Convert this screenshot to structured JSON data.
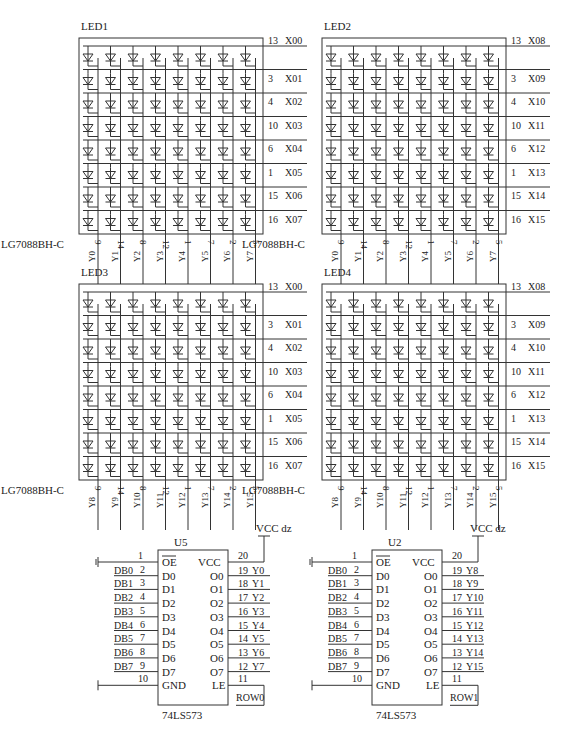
{
  "matrices": [
    {
      "ref": "LED1",
      "part": "LG7088BH-C",
      "x": 79,
      "y": 38,
      "rows": [
        [
          "13",
          "X00"
        ],
        [
          "3",
          "X01"
        ],
        [
          "4",
          "X02"
        ],
        [
          "10",
          "X03"
        ],
        [
          "6",
          "X04"
        ],
        [
          "1",
          "X05"
        ],
        [
          "15",
          "X06"
        ],
        [
          "16",
          "X07"
        ]
      ],
      "cols": [
        [
          "9",
          "Y0"
        ],
        [
          "14",
          "Y1"
        ],
        [
          "8",
          "Y2"
        ],
        [
          "12",
          "Y3"
        ],
        [
          "1",
          "Y4"
        ],
        [
          "7",
          "Y5"
        ],
        [
          "2",
          "Y6"
        ],
        [
          "5",
          "Y7"
        ]
      ]
    },
    {
      "ref": "LED2",
      "part": "LG7088BH-C",
      "x": 322,
      "y": 38,
      "rows": [
        [
          "13",
          "X08"
        ],
        [
          "3",
          "X09"
        ],
        [
          "4",
          "X10"
        ],
        [
          "10",
          "X11"
        ],
        [
          "6",
          "X12"
        ],
        [
          "1",
          "X13"
        ],
        [
          "15",
          "X14"
        ],
        [
          "16",
          "X15"
        ]
      ],
      "cols": [
        [
          "9",
          "Y0"
        ],
        [
          "14",
          "Y1"
        ],
        [
          "8",
          "Y2"
        ],
        [
          "12",
          "Y3"
        ],
        [
          "1",
          "Y4"
        ],
        [
          "7",
          "Y5"
        ],
        [
          "2",
          "Y6"
        ],
        [
          "5",
          "Y7"
        ]
      ]
    },
    {
      "ref": "LED3",
      "part": "LG7088BH-C",
      "x": 79,
      "y": 284,
      "rows": [
        [
          "13",
          "X00"
        ],
        [
          "3",
          "X01"
        ],
        [
          "4",
          "X02"
        ],
        [
          "10",
          "X03"
        ],
        [
          "6",
          "X04"
        ],
        [
          "1",
          "X05"
        ],
        [
          "15",
          "X06"
        ],
        [
          "16",
          "X07"
        ]
      ],
      "cols": [
        [
          "9",
          "Y8"
        ],
        [
          "14",
          "Y9"
        ],
        [
          "8",
          "Y10"
        ],
        [
          "12",
          "Y11"
        ],
        [
          "1",
          "Y12"
        ],
        [
          "7",
          "Y13"
        ],
        [
          "2",
          "Y14"
        ],
        [
          "5",
          "Y15"
        ]
      ]
    },
    {
      "ref": "LED4",
      "part": "LG7088BH-C",
      "x": 322,
      "y": 284,
      "rows": [
        [
          "13",
          "X08"
        ],
        [
          "3",
          "X09"
        ],
        [
          "4",
          "X10"
        ],
        [
          "10",
          "X11"
        ],
        [
          "6",
          "X12"
        ],
        [
          "1",
          "X13"
        ],
        [
          "15",
          "X14"
        ],
        [
          "16",
          "X15"
        ]
      ],
      "cols": [
        [
          "9",
          "Y8"
        ],
        [
          "14",
          "Y9"
        ],
        [
          "8",
          "Y10"
        ],
        [
          "12",
          "Y11"
        ],
        [
          "1",
          "Y12"
        ],
        [
          "7",
          "Y13"
        ],
        [
          "2",
          "Y14"
        ],
        [
          "5",
          "Y15"
        ]
      ]
    }
  ],
  "latches": [
    {
      "ref": "U5",
      "part": "74LS573",
      "x": 158,
      "y": 550,
      "power_label": "VCC dz",
      "oe_pin": "1",
      "oe_label": "OE",
      "vcc_pin": "20",
      "vcc_label": "VCC",
      "gnd_pin": "10",
      "gnd_label": "GND",
      "le_pin": "11",
      "le_label": "LE",
      "le_net": "ROW0",
      "inputs": [
        [
          "DB0",
          "2",
          "D0"
        ],
        [
          "DB1",
          "3",
          "D1"
        ],
        [
          "DB2",
          "4",
          "D2"
        ],
        [
          "DB3",
          "5",
          "D3"
        ],
        [
          "DB4",
          "6",
          "D4"
        ],
        [
          "DB5",
          "7",
          "D5"
        ],
        [
          "DB6",
          "8",
          "D6"
        ],
        [
          "DB7",
          "9",
          "D7"
        ]
      ],
      "outputs": [
        [
          "O0",
          "19",
          "Y0"
        ],
        [
          "O1",
          "18",
          "Y1"
        ],
        [
          "O2",
          "17",
          "Y2"
        ],
        [
          "O3",
          "16",
          "Y3"
        ],
        [
          "O4",
          "15",
          "Y4"
        ],
        [
          "O5",
          "14",
          "Y5"
        ],
        [
          "O6",
          "13",
          "Y6"
        ],
        [
          "O7",
          "12",
          "Y7"
        ]
      ]
    },
    {
      "ref": "U2",
      "part": "74LS573",
      "x": 372,
      "y": 550,
      "power_label": "VCC dz",
      "oe_pin": "1",
      "oe_label": "OE",
      "vcc_pin": "20",
      "vcc_label": "VCC",
      "gnd_pin": "10",
      "gnd_label": "GND",
      "le_pin": "11",
      "le_label": "LE",
      "le_net": "ROW1",
      "inputs": [
        [
          "DB0",
          "2",
          "D0"
        ],
        [
          "DB1",
          "3",
          "D1"
        ],
        [
          "DB2",
          "4",
          "D2"
        ],
        [
          "DB3",
          "5",
          "D3"
        ],
        [
          "DB4",
          "6",
          "D4"
        ],
        [
          "DB5",
          "7",
          "D5"
        ],
        [
          "DB6",
          "8",
          "D6"
        ],
        [
          "DB7",
          "9",
          "D7"
        ]
      ],
      "outputs": [
        [
          "O0",
          "19",
          "Y8"
        ],
        [
          "O1",
          "18",
          "Y9"
        ],
        [
          "O2",
          "17",
          "Y10"
        ],
        [
          "O3",
          "16",
          "Y11"
        ],
        [
          "O4",
          "15",
          "Y12"
        ],
        [
          "O5",
          "14",
          "Y13"
        ],
        [
          "O6",
          "13",
          "Y14"
        ],
        [
          "O7",
          "12",
          "Y15"
        ]
      ]
    }
  ]
}
